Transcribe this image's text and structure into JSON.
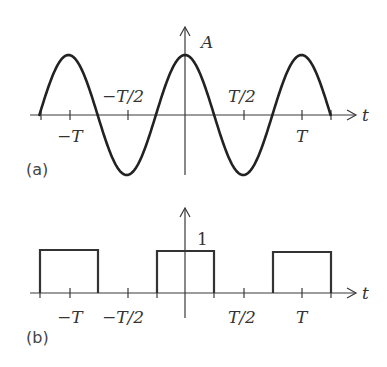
{
  "panels": [
    {
      "id": "a",
      "panel_label": "(a)",
      "y_axis_label": "A",
      "x_axis_label": "t",
      "tick_labels": {
        "neg_T": "−T",
        "neg_half_T": "−T/2",
        "half_T": "T/2",
        "T": "T"
      },
      "waveform": "cosine",
      "description": "Cosine wave of amplitude A and period T, drawn from -1.25T to 1.25T"
    },
    {
      "id": "b",
      "panel_label": "(b)",
      "y_axis_label": "1",
      "x_axis_label": "t",
      "tick_labels": {
        "neg_T": "−T",
        "neg_half_T": "−T/2",
        "half_T": "T/2",
        "T": "T"
      },
      "waveform": "square_pulse_train",
      "description": "Rectangular pulses of height 1, width T/2, centered at -T, 0, T"
    }
  ],
  "chart_data": [
    {
      "type": "line",
      "title": "(a)",
      "xlabel": "t",
      "ylabel": "A",
      "x_ticks": [
        "−T",
        "−T/2",
        "T/2",
        "T"
      ],
      "function": "A*cos(2*pi*t/T)",
      "x_range": [
        "-1.25T",
        "1.25T"
      ],
      "x": [
        -1.25,
        -1.0,
        -0.75,
        -0.5,
        -0.25,
        0,
        0.25,
        0.5,
        0.75,
        1.0,
        1.25
      ],
      "values": [
        0,
        1,
        0,
        -1,
        0,
        1,
        0,
        -1,
        0,
        1,
        0
      ],
      "grid": false
    },
    {
      "type": "line",
      "title": "(b)",
      "xlabel": "t",
      "ylabel": "1",
      "x_ticks": [
        "−T",
        "−T/2",
        "T/2",
        "T"
      ],
      "function": "rectangular pulse train, height 1, width T/2, period T",
      "x": [
        -1.25,
        -1.25,
        -0.75,
        -0.75,
        -0.25,
        -0.25,
        0.25,
        0.25,
        0.75,
        0.75,
        1.25,
        1.25
      ],
      "values": [
        0,
        1,
        1,
        0,
        0,
        1,
        1,
        0,
        0,
        1,
        1,
        0
      ],
      "grid": false
    }
  ]
}
